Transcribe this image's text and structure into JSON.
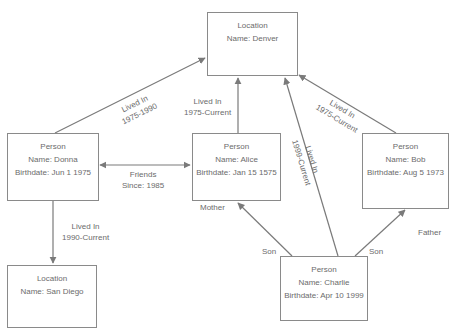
{
  "nodes": {
    "denver": {
      "type": "Location",
      "name": "Name: Denver"
    },
    "donna": {
      "type": "Person",
      "name": "Name: Donna",
      "birthdate": "Birthdate: Jun 1 1975"
    },
    "alice": {
      "type": "Person",
      "name": "Name: Alice",
      "birthdate": "Birthdate: Jan 15 1575"
    },
    "bob": {
      "type": "Person",
      "name": "Name: Bob",
      "birthdate": "Birthdate: Aug 5 1973"
    },
    "charlie": {
      "type": "Person",
      "name": "Name: Charlie",
      "birthdate": "Birthdate: Apr 10 1999"
    },
    "sandiego": {
      "type": "Location",
      "name": "Name: San Diego"
    }
  },
  "edges": {
    "donna_denver": {
      "line1": "Lived In",
      "line2": "1975-1990"
    },
    "alice_denver": {
      "line1": "Lived In",
      "line2": "1975-Current"
    },
    "bob_denver": {
      "line1": "Lived In",
      "line2": "1975-Current"
    },
    "charlie_denver": {
      "line1": "Lived In",
      "line2": "1999-Current"
    },
    "donna_alice": {
      "line1": "Friends",
      "line2": "Since: 1985"
    },
    "donna_sandiego": {
      "line1": "Lived In",
      "line2": "1990-Current"
    },
    "charlie_alice": {
      "source_label": "Son",
      "target_label": "Mother"
    },
    "charlie_bob": {
      "source_label": "Son",
      "target_label": "Father"
    }
  },
  "colors": {
    "line": "#7a7a7a",
    "border": "#8a8a8a",
    "text": "#6b6b6b"
  }
}
